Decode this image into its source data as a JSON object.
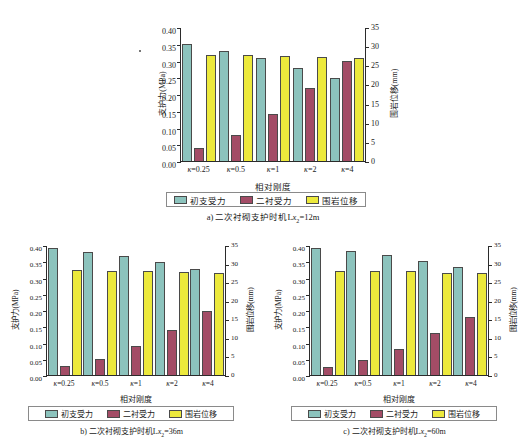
{
  "figure": {
    "series_names": [
      "初支受力",
      "二衬受力",
      "围岩位移"
    ],
    "colors": {
      "primary_support": "#8cc3bd",
      "secondary_lining": "#a34c66",
      "rock_displacement": "#ece93c",
      "axis": "#2b2b2b",
      "bar_outline": "#4a4a4a",
      "legend_border": "#8a8a8a"
    }
  },
  "chart_data": [
    {
      "type": "bar",
      "title": "a) 二次衬砌支护时机L",
      "caption_sub": "x2",
      "caption_tail": "=12m",
      "caption_full": "a) 二次衬砌支护时机Lx2=12m",
      "categories": [
        "κ=0.25",
        "κ=0.5",
        "κ=1",
        "κ=2",
        "κ=4"
      ],
      "xlabel": "相对刚度",
      "ylabel": "支护力(MPa)",
      "ylabel_right": "围岩位移(mm)",
      "ylim": [
        0.0,
        0.4
      ],
      "yticks": [
        "0.00",
        "0.05",
        "0.10",
        "0.15",
        "0.20",
        "0.25",
        "0.30",
        "0.35",
        "0.40"
      ],
      "ylim_right": [
        0,
        35
      ],
      "yticks_right": [
        "0",
        "5",
        "10",
        "15",
        "20",
        "25",
        "30",
        "35"
      ],
      "grid": false,
      "legend_position": "bottom",
      "series": [
        {
          "name": "初支受力",
          "axis": "left",
          "unit": "MPa",
          "values": [
            0.35,
            0.329,
            0.309,
            0.279,
            0.249
          ]
        },
        {
          "name": "二衬受力",
          "axis": "left",
          "unit": "MPa",
          "values": [
            0.04,
            0.079,
            0.14,
            0.219,
            0.299
          ]
        },
        {
          "name": "围岩位移",
          "axis": "right",
          "unit": "mm",
          "values": [
            27.8,
            27.7,
            27.4,
            27.1,
            26.9
          ]
        }
      ]
    },
    {
      "type": "bar",
      "title": "b) 二次衬砌支护时机L",
      "caption_sub": "x2",
      "caption_tail": "=36m",
      "caption_full": "b) 二次衬砌支护时机Lx2=36m",
      "categories": [
        "κ=0.25",
        "κ=0.5",
        "κ=1",
        "κ=2",
        "κ=4"
      ],
      "xlabel": "相对刚度",
      "ylabel": "支护力(MPa)",
      "ylabel_right": "围岩位移(mm)",
      "ylim": [
        0.0,
        0.4
      ],
      "yticks": [
        "0.00",
        "0.05",
        "0.10",
        "0.15",
        "0.20",
        "0.25",
        "0.30",
        "0.35",
        "0.40"
      ],
      "ylim_right": [
        0,
        35
      ],
      "yticks_right": [
        "0",
        "5",
        "10",
        "15",
        "20",
        "25",
        "30",
        "35"
      ],
      "grid": false,
      "legend_position": "bottom",
      "series": [
        {
          "name": "初支受力",
          "axis": "left",
          "unit": "MPa",
          "values": [
            0.39,
            0.38,
            0.365,
            0.347,
            0.326
          ]
        },
        {
          "name": "二衬受力",
          "axis": "left",
          "unit": "MPa",
          "values": [
            0.027,
            0.05,
            0.088,
            0.14,
            0.196
          ]
        },
        {
          "name": "围岩位移",
          "axis": "right",
          "unit": "mm",
          "values": [
            28.2,
            28.1,
            28.0,
            27.8,
            27.6
          ]
        }
      ]
    },
    {
      "type": "bar",
      "title": "c) 二次衬砌支护时机L",
      "caption_sub": "x2",
      "caption_tail": "=60m",
      "caption_full": "c) 二次衬砌支护时机Lx2=60m",
      "categories": [
        "κ=0.25",
        "κ=0.5",
        "κ=1",
        "κ=2",
        "κ=4"
      ],
      "xlabel": "相对刚度",
      "ylabel": "支护力(MPa)",
      "ylabel_right": "围岩位移(mm)",
      "ylim": [
        0.0,
        0.4
      ],
      "yticks": [
        "0.00",
        "0.05",
        "0.10",
        "0.15",
        "0.20",
        "0.25",
        "0.30",
        "0.35",
        "0.40"
      ],
      "ylim_right": [
        0,
        35
      ],
      "yticks_right": [
        "0",
        "5",
        "10",
        "15",
        "20",
        "25",
        "30",
        "35"
      ],
      "grid": false,
      "legend_position": "bottom",
      "series": [
        {
          "name": "初支受力",
          "axis": "left",
          "unit": "MPa",
          "values": [
            0.392,
            0.383,
            0.37,
            0.352,
            0.332
          ]
        },
        {
          "name": "二衬受力",
          "axis": "left",
          "unit": "MPa",
          "values": [
            0.024,
            0.047,
            0.081,
            0.128,
            0.18
          ]
        },
        {
          "name": "围岩位移",
          "axis": "right",
          "unit": "mm",
          "values": [
            28.1,
            28.0,
            27.9,
            27.6,
            27.4
          ]
        }
      ]
    }
  ]
}
